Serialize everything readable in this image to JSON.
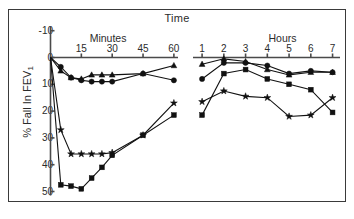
{
  "chart_data": {
    "type": "line",
    "title": "Time",
    "xlabel": "",
    "ylabel": "% Fall In FEV1",
    "ylim": [
      -10,
      52
    ],
    "yticks": [
      -10,
      0,
      10,
      20,
      30,
      40,
      50
    ],
    "ytick_labels": [
      "-10",
      "0",
      "10",
      "20",
      "30",
      "40",
      "50"
    ],
    "y_inverted": true,
    "grid": false,
    "legend": "none",
    "panels": [
      {
        "name": "minutes",
        "label": "Minutes",
        "xlabel_ticks": [
          "15",
          "30",
          "45",
          "60"
        ],
        "xtick_values": [
          15,
          30,
          45,
          60
        ],
        "xlim": [
          0,
          62
        ],
        "series": [
          {
            "name": "triangle-series",
            "marker": "triangle",
            "x": [
              0,
              5,
              10,
              15,
              20,
              25,
              30,
              45,
              60
            ],
            "values": [
              0,
              5,
              7.5,
              8,
              6.5,
              6.5,
              6.5,
              6,
              3
            ]
          },
          {
            "name": "circle-series",
            "marker": "circle",
            "x": [
              0,
              5,
              10,
              15,
              20,
              25,
              30,
              45,
              60
            ],
            "values": [
              0,
              3.5,
              7.5,
              8.5,
              9,
              9,
              9,
              6,
              8.5
            ]
          },
          {
            "name": "star-series",
            "marker": "star",
            "x": [
              0,
              5,
              10,
              15,
              20,
              25,
              30,
              45,
              60
            ],
            "values": [
              0,
              27,
              36,
              36,
              36,
              36,
              35.5,
              29,
              17
            ]
          },
          {
            "name": "square-series",
            "marker": "square",
            "x": [
              0,
              5,
              10,
              15,
              20,
              25,
              30,
              45,
              60
            ],
            "values": [
              0,
              47.5,
              48,
              49,
              45,
              41,
              36.5,
              29,
              21.5
            ]
          }
        ]
      },
      {
        "name": "hours",
        "label": "Hours",
        "xlabel_ticks": [
          "1",
          "2",
          "3",
          "4",
          "5",
          "6",
          "7"
        ],
        "xtick_values": [
          1,
          2,
          3,
          4,
          5,
          6,
          7
        ],
        "xlim": [
          0.72,
          7.2
        ],
        "series": [
          {
            "name": "triangle-series",
            "marker": "triangle",
            "x": [
              1,
              2,
              3,
              4,
              5,
              6,
              7
            ],
            "values": [
              2.5,
              0.5,
              1.5,
              4.5,
              6.5,
              5.5,
              5.5
            ]
          },
          {
            "name": "circle-series",
            "marker": "circle",
            "x": [
              1,
              2,
              3,
              4,
              5,
              6,
              7
            ],
            "values": [
              8,
              2,
              2,
              3,
              6,
              5,
              5.5
            ]
          },
          {
            "name": "square-series",
            "marker": "square",
            "x": [
              1,
              2,
              3,
              4,
              5,
              6,
              7
            ],
            "values": [
              21.5,
              6,
              4.5,
              8,
              10,
              12,
              20.5
            ]
          },
          {
            "name": "star-series",
            "marker": "star",
            "x": [
              1,
              2,
              3,
              4,
              5,
              6,
              7
            ],
            "values": [
              16.5,
              12.5,
              14.5,
              15,
              22,
              21.5,
              15
            ]
          }
        ]
      }
    ]
  }
}
